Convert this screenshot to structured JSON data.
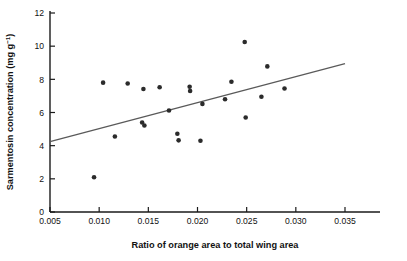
{
  "chart_data": {
    "type": "scatter",
    "title": "",
    "xlabel": "Ratio of orange area to total wing area",
    "ylabel_main": "Sarmentosin concentration (mg g",
    "ylabel_sup": "−1",
    "ylabel_close": ")",
    "ylabel_full": "Sarmentosin concentration (mg g⁻¹)",
    "xlim": [
      0.005,
      0.035
    ],
    "ylim": [
      0,
      12
    ],
    "xticks": [
      0.005,
      0.01,
      0.015,
      0.02,
      0.025,
      0.03,
      0.035
    ],
    "xtick_labels": [
      "0.005",
      "0.010",
      "0.015",
      "0.020",
      "0.025",
      "0.030",
      "0.035"
    ],
    "yticks": [
      0,
      2,
      4,
      6,
      8,
      10,
      12
    ],
    "ytick_labels": [
      "0",
      "2",
      "4",
      "6",
      "8",
      "10",
      "12"
    ],
    "grid": false,
    "legend": null,
    "marker": {
      "shape": "circle",
      "color": "#2b2b2b",
      "size_px": 4.6
    },
    "points": [
      {
        "x": 0.00948,
        "y": 2.1
      },
      {
        "x": 0.0104,
        "y": 7.8
      },
      {
        "x": 0.0116,
        "y": 4.55
      },
      {
        "x": 0.0129,
        "y": 7.75
      },
      {
        "x": 0.0145,
        "y": 7.42
      },
      {
        "x": 0.01437,
        "y": 5.4
      },
      {
        "x": 0.0146,
        "y": 5.22
      },
      {
        "x": 0.01615,
        "y": 7.52
      },
      {
        "x": 0.0171,
        "y": 6.12
      },
      {
        "x": 0.01795,
        "y": 4.72
      },
      {
        "x": 0.01808,
        "y": 4.32
      },
      {
        "x": 0.0192,
        "y": 7.55
      },
      {
        "x": 0.01925,
        "y": 7.3
      },
      {
        "x": 0.0203,
        "y": 4.3
      },
      {
        "x": 0.0205,
        "y": 6.52
      },
      {
        "x": 0.0228,
        "y": 6.8
      },
      {
        "x": 0.02345,
        "y": 7.85
      },
      {
        "x": 0.0248,
        "y": 10.25
      },
      {
        "x": 0.0249,
        "y": 5.7
      },
      {
        "x": 0.0265,
        "y": 6.95
      },
      {
        "x": 0.0271,
        "y": 8.78
      },
      {
        "x": 0.02885,
        "y": 7.45
      }
    ],
    "trendline": {
      "type": "linear",
      "color": "#5a5a5a",
      "x_start": 0.005,
      "y_start": 4.25,
      "x_end": 0.035,
      "y_end": 8.95
    }
  },
  "axes": {
    "spine_color": "#1a1a1a",
    "tick_color": "#1a1a1a"
  }
}
